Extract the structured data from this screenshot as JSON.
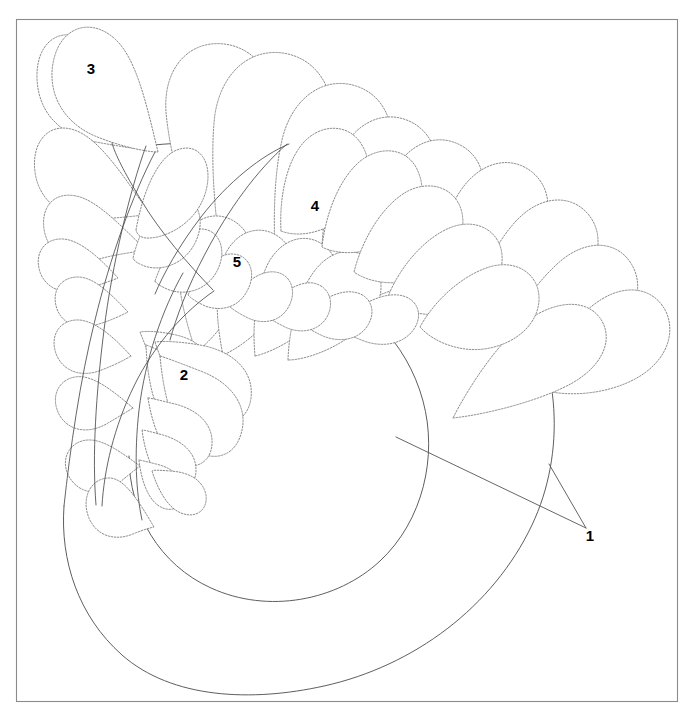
{
  "figure": {
    "background_color": "#ffffff",
    "frame_color": "#8b8b8b",
    "line_color": "#555555",
    "dashed_line_color": "#6f6f6f",
    "label_color": "#000000",
    "width": 696,
    "height": 721
  },
  "callouts": [
    {
      "id": "1",
      "label": "1",
      "x": 590,
      "y": 537,
      "name": "callout-1-spine-core"
    },
    {
      "id": "2",
      "label": "2",
      "x": 184,
      "y": 376,
      "name": "callout-2-inner-plume"
    },
    {
      "id": "3",
      "label": "3",
      "x": 91,
      "y": 70,
      "name": "callout-3-outer-plume"
    },
    {
      "id": "4",
      "label": "4",
      "x": 315,
      "y": 207,
      "name": "callout-4-mid-plume"
    },
    {
      "id": "5",
      "label": "5",
      "x": 237,
      "y": 263,
      "name": "callout-5-small-plume"
    }
  ],
  "leaders": [
    {
      "name": "leader-line-inner-circle",
      "path": "M 396 437 L 586 528"
    },
    {
      "name": "leader-line-outer-spiral",
      "path": "M 549 464 L 586 528"
    }
  ],
  "frame": {
    "x": 16,
    "y": 19,
    "width": 662,
    "height": 683
  },
  "spirals": [
    {
      "name": "outer-spiral-spine",
      "path": "M 64 506 C 60 560 78 616 122 655 C 172 699 252 702 324 686 C 414 666 493 607 532 525 C 566 453 561 363 517 296 C 474 231 400 186 326 163 C 258 142 190 140 146 146"
    },
    {
      "name": "inner-spiral-spine",
      "path": "M 129 456 C 129 514 160 565 211 588 C 268 614 337 601 380 561 C 423 521 438 456 423 401 C 407 341 360 296 305 278 C 260 263 214 264 183 273"
    }
  ],
  "plume_groups": [
    {
      "name": "outer-left-plume-group",
      "count": 9
    },
    {
      "name": "top-arc-plume-group",
      "count": 10
    },
    {
      "name": "mid-arc-plume-group",
      "count": 11
    },
    {
      "name": "inner-plume-group",
      "count": 8
    }
  ]
}
